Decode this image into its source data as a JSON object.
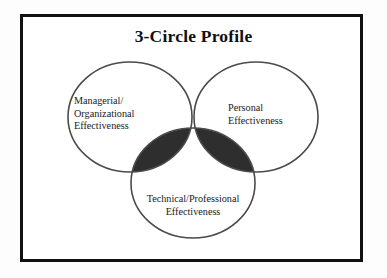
{
  "figure": {
    "title": "3-Circle Profile",
    "type": "venn-diagram-3",
    "frame": {
      "border_color": "#111111",
      "background": "#ffffff"
    },
    "outline_color": "#4a4a4a",
    "circles": [
      {
        "id": "managerial",
        "label": "Managerial/\nOrganizational\nEffectiveness",
        "label_lines": [
          "Managerial/",
          "Organizational",
          "Effectiveness"
        ],
        "position": "left",
        "cx": 130,
        "cy": 117,
        "rx": 62,
        "ry": 55,
        "fill": "none"
      },
      {
        "id": "personal",
        "label": "Personal\nEffectiveness",
        "label_lines": [
          "Personal",
          "Effectiveness"
        ],
        "position": "right",
        "cx": 256,
        "cy": 117,
        "rx": 62,
        "ry": 55,
        "fill": "none"
      },
      {
        "id": "technical",
        "label": "Technical/Professional\nEffectiveness",
        "label_lines": [
          "Technical/Professional",
          "Effectiveness"
        ],
        "position": "bottom",
        "cx": 193,
        "cy": 183,
        "rx": 62,
        "ry": 55,
        "fill": "none"
      }
    ],
    "overlaps": [
      {
        "id": "managerial-personal",
        "members": [
          "managerial",
          "personal"
        ],
        "fill": "#6e6e6e"
      },
      {
        "id": "managerial-technical",
        "members": [
          "managerial",
          "technical"
        ],
        "fill": "#2e2e2e"
      },
      {
        "id": "personal-technical",
        "members": [
          "personal",
          "technical"
        ],
        "fill": "#2e2e2e"
      },
      {
        "id": "all-three",
        "members": [
          "managerial",
          "personal",
          "technical"
        ],
        "fill": "#242424"
      }
    ]
  }
}
